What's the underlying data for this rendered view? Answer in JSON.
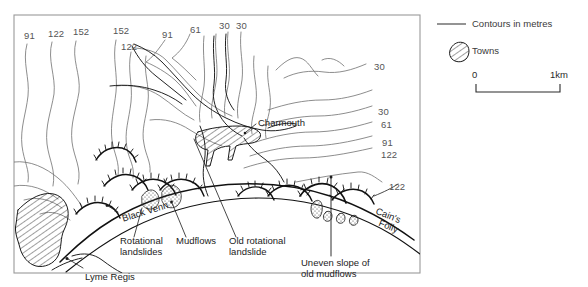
{
  "figure": {
    "kind": "geomorphological-map",
    "frame_color": "#9a9a9a",
    "contour_color": "#6e6e6e",
    "feature_color": "#111111"
  },
  "map": {
    "contour_labels": [
      {
        "id": "c-left-91",
        "value": "91",
        "x": 24,
        "y": 31
      },
      {
        "id": "c-left-122",
        "value": "122",
        "x": 48,
        "y": 29
      },
      {
        "id": "c-left-152",
        "value": "152",
        "x": 73,
        "y": 27
      },
      {
        "id": "c-mid-152",
        "value": "152",
        "x": 113,
        "y": 26
      },
      {
        "id": "c-mid-122",
        "value": "122",
        "x": 121,
        "y": 42
      },
      {
        "id": "c-mid-91",
        "value": "91",
        "x": 162,
        "y": 30
      },
      {
        "id": "c-mid-61",
        "value": "61",
        "x": 190,
        "y": 25
      },
      {
        "id": "c-top-30a",
        "value": "30",
        "x": 219,
        "y": 21
      },
      {
        "id": "c-top-30b",
        "value": "30",
        "x": 236,
        "y": 21
      },
      {
        "id": "c-right-30a",
        "value": "30",
        "x": 374,
        "y": 62
      },
      {
        "id": "c-right-30b",
        "value": "30",
        "x": 378,
        "y": 107
      },
      {
        "id": "c-right-61",
        "value": "61",
        "x": 381,
        "y": 120
      },
      {
        "id": "c-right-91",
        "value": "91",
        "x": 382,
        "y": 138
      },
      {
        "id": "c-right-122a",
        "value": "122",
        "x": 381,
        "y": 150
      },
      {
        "id": "c-right-122b",
        "value": "122",
        "x": 389,
        "y": 182
      }
    ],
    "place_labels": [
      {
        "id": "charmouth",
        "text": "Charmouth",
        "x": 258,
        "y": 118
      },
      {
        "id": "lyme-regis",
        "text": "Lyme Regis",
        "x": 85,
        "y": 272
      },
      {
        "id": "black-venn",
        "text": "Black Venn",
        "x": 121,
        "y": 214,
        "rotate": -17
      },
      {
        "id": "cains-folly-1",
        "text": "Cain's",
        "x": 378,
        "y": 209,
        "rotate": 22
      },
      {
        "id": "cains-folly-2",
        "text": "Folly",
        "x": 379,
        "y": 221,
        "rotate": 22
      }
    ],
    "annotations": [
      {
        "id": "rotational-landslides",
        "line1": "Rotational",
        "line2": "landslides",
        "x": 120,
        "y": 241
      },
      {
        "id": "mudflows",
        "line1": "Mudflows",
        "line2": "",
        "x": 175,
        "y": 241
      },
      {
        "id": "old-rotational",
        "line1": "Old rotational",
        "line2": "landslide",
        "x": 228,
        "y": 241
      },
      {
        "id": "uneven-slope",
        "line1": "Uneven slope of",
        "line2": "old mudflows",
        "x": 302,
        "y": 263
      }
    ]
  },
  "legend": {
    "contours_label": "Contours in metres",
    "towns_label": "Towns",
    "scale_start": "0",
    "scale_end": "1km"
  }
}
